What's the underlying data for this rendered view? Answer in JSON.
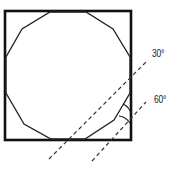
{
  "diagram": {
    "type": "geometric-construction",
    "shape_outer": "square",
    "shape_inner": "dodecagon",
    "angle_labels": [
      {
        "text": "30°",
        "x": 152,
        "y": 48
      },
      {
        "text": "60°",
        "x": 154,
        "y": 94
      }
    ],
    "colors": {
      "stroke": "#111111",
      "dashed": "#333333",
      "background": "#ffffff"
    }
  }
}
